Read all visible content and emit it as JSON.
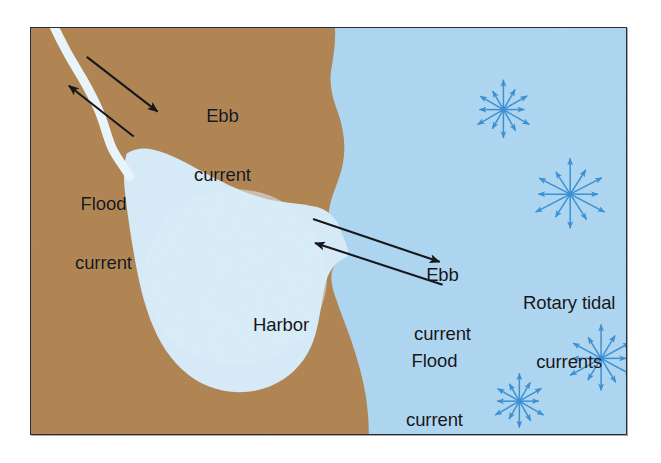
{
  "figure": {
    "type": "oceanography-diagram",
    "frame": {
      "border_color": "#2c2c34"
    },
    "colors": {
      "land": "#b08552",
      "ocean": "#aed6f1",
      "harbor": "#d6eaf8",
      "river": "#eaf4fb",
      "arrow": "#15161a",
      "rotary_arrow": "#3a90d4",
      "background": "#ffffff"
    }
  },
  "labels": [
    {
      "id": "ebb-current-river",
      "text": "Ebb\ncurrent",
      "line1": "Ebb",
      "line2": "current",
      "x": 163,
      "y": 38,
      "placement": "over-land-upper-left"
    },
    {
      "id": "flood-current-river",
      "text": "Flood\ncurrent",
      "line1": "Flood",
      "line2": "current",
      "x": 44,
      "y": 126,
      "placement": "over-land-left"
    },
    {
      "id": "harbor",
      "text": "Harbor",
      "line1": "Harbor",
      "line2": "",
      "x": 222,
      "y": 247,
      "placement": "inside-harbor"
    },
    {
      "id": "ebb-current-inlet",
      "text": "Ebb\ncurrent",
      "line1": "Ebb",
      "line2": "current",
      "x": 383,
      "y": 197,
      "placement": "over-ocean-inlet"
    },
    {
      "id": "flood-current-inlet",
      "text": "Flood\ncurrent",
      "line1": "Flood",
      "line2": "current",
      "x": 375,
      "y": 283,
      "placement": "over-ocean-inlet"
    },
    {
      "id": "rotary-tidal-currents",
      "text": "Rotary tidal\ncurrents",
      "line1": "Rotary tidal",
      "line2": "currents",
      "x": 492,
      "y": 225,
      "placement": "over-ocean-right"
    }
  ],
  "current_arrows": [
    {
      "id": "ebb-arrow-river",
      "label": "Ebb current",
      "x1": 86,
      "y1": 56,
      "x2": 159,
      "y2": 111,
      "direction": "downstream-seaward",
      "head_at": "end"
    },
    {
      "id": "flood-arrow-river",
      "label": "Flood current",
      "x1": 133,
      "y1": 136,
      "x2": 68,
      "y2": 85,
      "direction": "upstream-landward",
      "head_at": "end"
    },
    {
      "id": "ebb-arrow-inlet",
      "label": "Ebb current",
      "x1": 313,
      "y1": 219,
      "x2": 440,
      "y2": 262,
      "direction": "harbor-to-ocean",
      "head_at": "end"
    },
    {
      "id": "flood-arrow-inlet",
      "label": "Flood current",
      "x1": 443,
      "y1": 285,
      "x2": 315,
      "y2": 243,
      "direction": "ocean-to-harbor",
      "head_at": "end"
    }
  ],
  "rotary_symbols": [
    {
      "id": "rotary-1",
      "cx": 474,
      "cy": 82,
      "radius_x": 30,
      "radius_y": 30,
      "n_arrows": 12,
      "note": "upper rotary tidal current ellipse"
    },
    {
      "id": "rotary-2",
      "cx": 541,
      "cy": 167,
      "radius_x": 40,
      "radius_y": 36,
      "n_arrows": 12,
      "note": "large middle-right rotary tidal current ellipse"
    },
    {
      "id": "rotary-3",
      "cx": 572,
      "cy": 332,
      "radius_x": 36,
      "radius_y": 34,
      "n_arrows": 12,
      "note": "lower-right rotary tidal current ellipse"
    },
    {
      "id": "rotary-4",
      "cx": 490,
      "cy": 375,
      "radius_x": 28,
      "radius_y": 28,
      "n_arrows": 12,
      "note": "bottom rotary tidal current ellipse"
    }
  ],
  "chart_data": {
    "type": "diagram",
    "regions": [
      {
        "name": "land",
        "color": "#b08552",
        "description": "Coastal landmass occupying the left two-thirds of the frame"
      },
      {
        "name": "ocean",
        "color": "#aed6f1",
        "description": "Open ocean on the right side of the coastline"
      },
      {
        "name": "harbor",
        "color": "#d6eaf8",
        "description": "Enclosed teardrop-shaped harbor connected to the ocean by a narrow inlet"
      },
      {
        "name": "river",
        "color": "#eaf4fb",
        "description": "Narrow meandering river entering the harbor from the upper-left corner"
      }
    ],
    "annotations": [
      "Ebb current",
      "Flood current",
      "Harbor",
      "Ebb current",
      "Flood current",
      "Rotary tidal currents"
    ]
  }
}
